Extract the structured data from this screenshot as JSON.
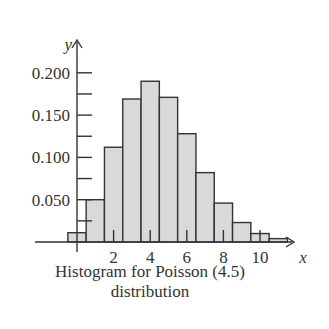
{
  "chart_data": {
    "type": "bar",
    "xlabel": "x",
    "ylabel": "y",
    "x": [
      0,
      1,
      2,
      3,
      4,
      5,
      6,
      7,
      8,
      9,
      10,
      11
    ],
    "values": [
      0.011,
      0.05,
      0.112,
      0.169,
      0.19,
      0.171,
      0.128,
      0.082,
      0.046,
      0.023,
      0.01,
      0.004
    ],
    "x_tick_labels": [
      "2",
      "4",
      "6",
      "8",
      "10"
    ],
    "x_ticks": [
      2,
      4,
      6,
      8,
      10
    ],
    "y_tick_labels": [
      "0.050",
      "0.100",
      "0.150",
      "0.200"
    ],
    "y_ticks": [
      0.05,
      0.1,
      0.15,
      0.2
    ],
    "ylim": [
      0,
      0.21
    ],
    "xlim": [
      -0.5,
      11.5
    ],
    "grid": false,
    "bar_fill": "#d9d9d9",
    "bar_stroke": "#333333"
  },
  "caption": {
    "line1": "Histogram for Poisson (4.5)",
    "line2": "distribution"
  }
}
